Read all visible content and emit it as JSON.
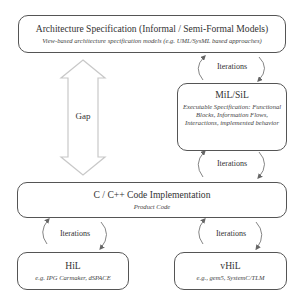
{
  "diagram": {
    "boxes": {
      "architecture": {
        "title": "Architecture Specification (Informal / Semi-Formal Models)",
        "subtitle": "View-based architecture specification models (e.g. UML/SysML based approaches)"
      },
      "mil_sil": {
        "title": "MiL/SiL",
        "subtitle": "Executable Specification: Functional Blocks, Information Flows, Interactions, implemented behavior"
      },
      "code": {
        "title": "C / C++ Code Implementation",
        "subtitle": "Product Code"
      },
      "hil": {
        "title": "HiL",
        "subtitle": "e.g. IPG Carmaker, dSPACE"
      },
      "vhil": {
        "title": "vHiL",
        "subtitle": "e.g., gem5, SystemC/TLM"
      }
    },
    "gap_label": "Gap",
    "iterations": [
      {
        "label": "Iterations",
        "between": "architecture-mil_sil"
      },
      {
        "label": "Iterations",
        "between": "mil_sil-code"
      },
      {
        "label": "Iterations",
        "between": "code-hil"
      },
      {
        "label": "Iterations",
        "between": "code-vhil"
      }
    ],
    "colors": {
      "box_border": "#555555",
      "gap_arrow": "#c8c8c8",
      "iteration_arrow": "#666666"
    }
  }
}
